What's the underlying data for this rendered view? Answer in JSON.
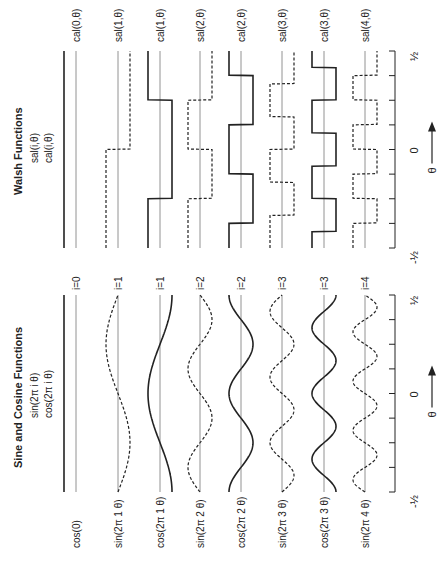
{
  "figure": {
    "orientation": "rotated 90° counter-clockwise",
    "walsh": {
      "title": "Walsh Functions",
      "subtitle_1": "sal(i,θ)",
      "subtitle_2": "cal(i,θ)",
      "rows": [
        {
          "index_label": "i=0",
          "label": "cal(0,θ)",
          "kind": "cal",
          "order": 0,
          "style": "solid"
        },
        {
          "index_label": "i=1",
          "label": "sal(1,θ)",
          "kind": "sal",
          "order": 1,
          "style": "dashed"
        },
        {
          "index_label": "i=1",
          "label": "cal(1,θ)",
          "kind": "cal",
          "order": 1,
          "style": "solid"
        },
        {
          "index_label": "i=2",
          "label": "sal(2,θ)",
          "kind": "sal",
          "order": 2,
          "style": "dashed"
        },
        {
          "index_label": "i=2",
          "label": "cal(2,θ)",
          "kind": "cal",
          "order": 2,
          "style": "solid"
        },
        {
          "index_label": "i=3",
          "label": "sal(3,θ)",
          "kind": "sal",
          "order": 3,
          "style": "dashed"
        },
        {
          "index_label": "i=3",
          "label": "cal(3,θ)",
          "kind": "cal",
          "order": 3,
          "style": "solid"
        },
        {
          "index_label": "i=4",
          "label": "sal(4,θ)",
          "kind": "sal",
          "order": 4,
          "style": "dashed"
        }
      ],
      "axis": {
        "min_label": "-½",
        "mid_label": "0",
        "max_label": "½",
        "var_label": "θ"
      }
    },
    "sine": {
      "title": "Sine and Cosine Functions",
      "subtitle_1": "sin(2π i θ)",
      "subtitle_2": "cos(2π i θ)",
      "rows": [
        {
          "label": "cos(0)",
          "kind": "cos",
          "order": 0,
          "style": "solid"
        },
        {
          "label": "sin(2π 1 θ)",
          "kind": "sin",
          "order": 1,
          "style": "dashed"
        },
        {
          "label": "cos(2π 1 θ)",
          "kind": "cos",
          "order": 1,
          "style": "solid"
        },
        {
          "label": "sin(2π 2 θ)",
          "kind": "sin",
          "order": 2,
          "style": "dashed"
        },
        {
          "label": "cos(2π 2 θ)",
          "kind": "cos",
          "order": 2,
          "style": "solid"
        },
        {
          "label": "sin(2π 3 θ)",
          "kind": "sin",
          "order": 3,
          "style": "dashed"
        },
        {
          "label": "cos(2π 3 θ)",
          "kind": "cos",
          "order": 3,
          "style": "solid"
        },
        {
          "label": "sin(2π 4 θ)",
          "kind": "sin",
          "order": 4,
          "style": "dashed"
        }
      ],
      "axis": {
        "min_label": "-½",
        "mid_label": "0",
        "max_label": "½",
        "var_label": "θ"
      }
    },
    "colors": {
      "ink": "#222222",
      "baseline": "#777777"
    }
  }
}
